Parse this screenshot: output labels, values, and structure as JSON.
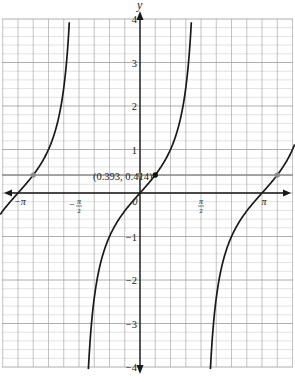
{
  "chart_data": {
    "type": "line",
    "title": "",
    "function": "y = tan(x)",
    "xlabel": "",
    "ylabel": "y",
    "xlim": [
      -3.55,
      3.95
    ],
    "ylim": [
      -4,
      4
    ],
    "grid": true,
    "x_ticks": [
      {
        "value": -3.14159,
        "label": "−π"
      },
      {
        "value": -1.5708,
        "label": "−π/2"
      },
      {
        "value": 0,
        "label": "0"
      },
      {
        "value": 1.5708,
        "label": "π/2"
      },
      {
        "value": 3.14159,
        "label": "π"
      }
    ],
    "y_ticks": [
      {
        "value": 4,
        "label": "4"
      },
      {
        "value": 3,
        "label": "3"
      },
      {
        "value": 2,
        "label": "2"
      },
      {
        "value": 1,
        "label": "1"
      },
      {
        "value": -1,
        "label": "−1"
      },
      {
        "value": -2,
        "label": "−2"
      },
      {
        "value": -3,
        "label": "−3"
      },
      {
        "value": -4,
        "label": "−4"
      }
    ],
    "horizontal_line": {
      "y": 0.414,
      "color": "#8a8a8a"
    },
    "highlighted_point": {
      "x": 0.393,
      "y": 0.414,
      "label": "(0.393, 0.414)",
      "color": "#111111"
    },
    "other_points": [
      {
        "x": -2.749,
        "y": 0.414,
        "color": "#8a8a8a"
      },
      {
        "x": 0,
        "y": 0.414,
        "color": "#8a8a8a"
      },
      {
        "x": 3.534,
        "y": 0.414,
        "color": "#8a8a8a"
      }
    ],
    "asymptotes": [
      -1.5708,
      1.5708
    ],
    "series": [
      {
        "name": "tan(x) branch 1",
        "x_range": [
          -3.55,
          -1.62
        ]
      },
      {
        "name": "tan(x) branch 2",
        "x_range": [
          -1.52,
          1.52
        ]
      },
      {
        "name": "tan(x) branch 3",
        "x_range": [
          1.62,
          3.95
        ]
      }
    ]
  },
  "labels": {
    "y_axis": "y",
    "origin": "0",
    "point_annotation": "(0.393, 0.414)"
  },
  "colors": {
    "curve": "#1a1a1a",
    "axis": "#1a1a1a",
    "grid_major": "#9a9a9a",
    "grid_minor": "#cfcfcf",
    "highlight_line": "#8a8a8a"
  }
}
